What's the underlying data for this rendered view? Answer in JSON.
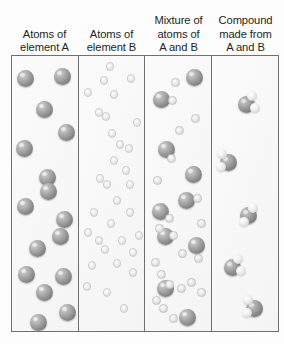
{
  "figure": {
    "panel_count": 4,
    "background_color": "#fdfdfd",
    "border_color": "#6f6f6f"
  },
  "headers": [
    {
      "id": "atoms-of-element-a",
      "lines": [
        "Atoms of",
        "element A"
      ]
    },
    {
      "id": "atoms-of-element-b",
      "lines": [
        "Atoms of",
        "element B"
      ]
    },
    {
      "id": "mixture-of-atoms-of-a-and-b",
      "lines": [
        "Mixture of",
        "atoms of",
        "A and B"
      ]
    },
    {
      "id": "compound-made-from-a-and-b",
      "lines": [
        "Compound",
        "made from",
        "A and B"
      ]
    }
  ],
  "legend": {
    "atom_a_label": "Atom of element A",
    "atom_a_color": "#9a9a9a",
    "atom_a_diameter_px": 17,
    "atom_b_label": "Atom of element B",
    "atom_b_color": "#e2e2e2",
    "atom_b_diameter_px": 9
  },
  "panels": [
    {
      "id": "panel-atoms-a",
      "header_id": "atoms-of-element-a",
      "atom_a_count": 16,
      "atom_b_count": 0,
      "molecule_count": 0,
      "atoms_a": [
        {
          "x": 5,
          "y": 14
        },
        {
          "x": 42,
          "y": 12
        },
        {
          "x": 24,
          "y": 45
        },
        {
          "x": 46,
          "y": 68
        },
        {
          "x": 4,
          "y": 84
        },
        {
          "x": 27,
          "y": 113
        },
        {
          "x": 28,
          "y": 127
        },
        {
          "x": 5,
          "y": 142
        },
        {
          "x": 44,
          "y": 155
        },
        {
          "x": 40,
          "y": 172
        },
        {
          "x": 17,
          "y": 184
        },
        {
          "x": 6,
          "y": 210
        },
        {
          "x": 43,
          "y": 212
        },
        {
          "x": 24,
          "y": 228
        },
        {
          "x": 47,
          "y": 248
        },
        {
          "x": 18,
          "y": 258
        }
      ],
      "atoms_b": [],
      "molecules": []
    },
    {
      "id": "panel-atoms-b",
      "header_id": "atoms-of-element-b",
      "atom_a_count": 0,
      "atom_b_count": 32,
      "molecule_count": 0,
      "atoms_a": [],
      "atoms_b": [
        {
          "x": 27,
          "y": 6
        },
        {
          "x": 21,
          "y": 20
        },
        {
          "x": 48,
          "y": 18
        },
        {
          "x": 5,
          "y": 32
        },
        {
          "x": 31,
          "y": 34
        },
        {
          "x": 16,
          "y": 52
        },
        {
          "x": 23,
          "y": 56
        },
        {
          "x": 54,
          "y": 62
        },
        {
          "x": 29,
          "y": 73
        },
        {
          "x": 37,
          "y": 84
        },
        {
          "x": 46,
          "y": 88
        },
        {
          "x": 31,
          "y": 100
        },
        {
          "x": 43,
          "y": 110
        },
        {
          "x": 17,
          "y": 118
        },
        {
          "x": 24,
          "y": 124
        },
        {
          "x": 47,
          "y": 124
        },
        {
          "x": 34,
          "y": 140
        },
        {
          "x": 47,
          "y": 152
        },
        {
          "x": 11,
          "y": 152
        },
        {
          "x": 28,
          "y": 163
        },
        {
          "x": 5,
          "y": 172
        },
        {
          "x": 16,
          "y": 180
        },
        {
          "x": 22,
          "y": 189
        },
        {
          "x": 39,
          "y": 180
        },
        {
          "x": 50,
          "y": 192
        },
        {
          "x": 56,
          "y": 175
        },
        {
          "x": 9,
          "y": 205
        },
        {
          "x": 34,
          "y": 203
        },
        {
          "x": 50,
          "y": 212
        },
        {
          "x": 4,
          "y": 226
        },
        {
          "x": 24,
          "y": 232
        },
        {
          "x": 41,
          "y": 248
        }
      ],
      "molecules": []
    },
    {
      "id": "panel-mixture",
      "header_id": "mixture-of-atoms-of-a-and-b",
      "atom_a_count": 9,
      "atom_b_count": 22,
      "molecule_count": 0,
      "atoms_a": [
        {
          "x": 41,
          "y": 13
        },
        {
          "x": 8,
          "y": 35
        },
        {
          "x": 13,
          "y": 85
        },
        {
          "x": 40,
          "y": 110
        },
        {
          "x": 33,
          "y": 136
        },
        {
          "x": 7,
          "y": 147
        },
        {
          "x": 12,
          "y": 172
        },
        {
          "x": 43,
          "y": 181
        },
        {
          "x": 12,
          "y": 224
        },
        {
          "x": 34,
          "y": 253
        }
      ],
      "atoms_b": [
        {
          "x": 26,
          "y": 22
        },
        {
          "x": 23,
          "y": 40
        },
        {
          "x": 46,
          "y": 58
        },
        {
          "x": 30,
          "y": 70
        },
        {
          "x": 22,
          "y": 98
        },
        {
          "x": 8,
          "y": 120
        },
        {
          "x": 48,
          "y": 138
        },
        {
          "x": 52,
          "y": 163
        },
        {
          "x": 20,
          "y": 158
        },
        {
          "x": 10,
          "y": 168
        },
        {
          "x": 24,
          "y": 175
        },
        {
          "x": 33,
          "y": 193
        },
        {
          "x": 49,
          "y": 198
        },
        {
          "x": 6,
          "y": 202
        },
        {
          "x": 12,
          "y": 214
        },
        {
          "x": 20,
          "y": 224
        },
        {
          "x": 32,
          "y": 228
        },
        {
          "x": 42,
          "y": 222
        },
        {
          "x": 7,
          "y": 240
        },
        {
          "x": 14,
          "y": 248
        },
        {
          "x": 24,
          "y": 258
        },
        {
          "x": 52,
          "y": 232
        }
      ],
      "molecules": []
    },
    {
      "id": "panel-compound",
      "header_id": "compound-made-from-a-and-b",
      "atom_a_count": 0,
      "atom_b_count": 0,
      "molecule_count": 6,
      "molecule_formula_atoms_a": 1,
      "molecule_formula_atoms_b": 2,
      "atoms_a": [],
      "atoms_b": [],
      "molecules": [
        {
          "x": 22,
          "y": 35,
          "variant": "a"
        },
        {
          "x": 4,
          "y": 93,
          "variant": "flip"
        },
        {
          "x": 24,
          "y": 146,
          "variant": "v3"
        },
        {
          "x": 8,
          "y": 198,
          "variant": "a"
        },
        {
          "x": 30,
          "y": 239,
          "variant": "flip"
        },
        {
          "x": 12,
          "y": 288,
          "variant": "v3"
        }
      ]
    }
  ]
}
